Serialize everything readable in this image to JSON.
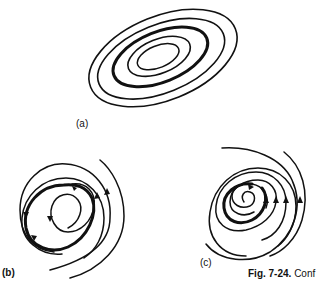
{
  "figure": {
    "panels": [
      {
        "id": "a",
        "label": "(a)",
        "description": "nested closed orbits with one heavy closed curve"
      },
      {
        "id": "b",
        "label": "(b)",
        "description": "trajectories spiraling toward a heavy limit cycle from inside and outside"
      },
      {
        "id": "c",
        "label": "(c)",
        "description": "trajectories spiraling inward toward a heavy inner cycle"
      }
    ],
    "caption": {
      "number": "Fig. 7-24.",
      "text": "Conf"
    },
    "colors": {
      "ink": "#111111",
      "background": "#ffffff"
    }
  }
}
